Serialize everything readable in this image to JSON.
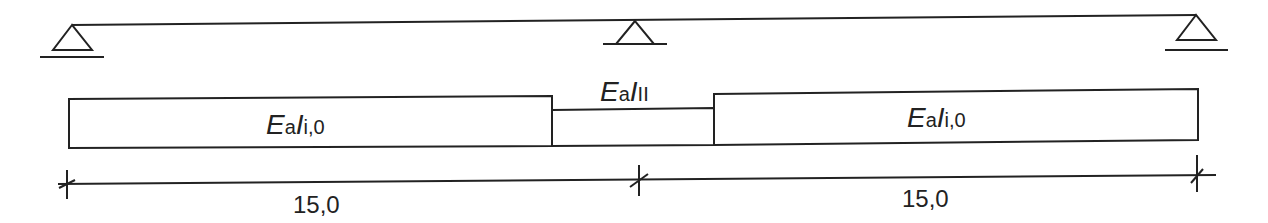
{
  "diagram": {
    "type": "continuous-beam-stiffness",
    "colors": {
      "stroke": "#222222",
      "background": "#ffffff"
    },
    "supports": [
      {
        "name": "left-support",
        "symbol": "pinned-triangle-icon"
      },
      {
        "name": "middle-support",
        "symbol": "pinned-triangle-icon"
      },
      {
        "name": "right-support",
        "symbol": "pinned-triangle-icon"
      }
    ],
    "segments": [
      {
        "name": "left-segment",
        "label_main": "E",
        "label_sub1": "a",
        "label_main2": "I",
        "label_sub2": "i,0"
      },
      {
        "name": "middle-segment",
        "label_main": "E",
        "label_sub1": "a",
        "label_main2": "I",
        "label_sub2": "II"
      },
      {
        "name": "right-segment",
        "label_main": "E",
        "label_sub1": "a",
        "label_main2": "I",
        "label_sub2": "i,0"
      }
    ],
    "dimensions": [
      {
        "name": "span-1",
        "value": "15,0"
      },
      {
        "name": "span-2",
        "value": "15,0"
      }
    ]
  }
}
